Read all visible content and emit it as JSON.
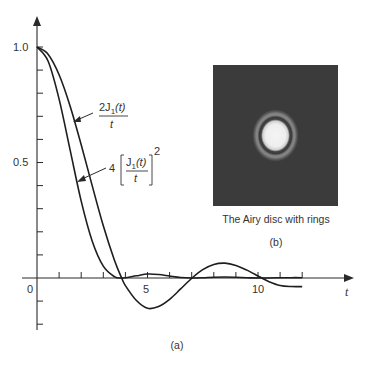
{
  "figure": {
    "panel_a_label": "(a)",
    "panel_b_label": "(b)",
    "airy_caption": "The Airy disc with rings",
    "colors": {
      "background": "#ffffff",
      "curve": "#1e1e1e",
      "airy_background": "#3b3b3b",
      "airy_disc": "#f2f2f2",
      "airy_ring": "#8a8a8a"
    }
  },
  "chart_data": {
    "type": "line",
    "title": "",
    "xlabel": "t",
    "ylabel": "",
    "xlim": [
      0,
      12.5
    ],
    "ylim": [
      -0.2,
      1.0
    ],
    "x_tick_labels": [
      "0",
      "5",
      "10"
    ],
    "x_minor_ticks": [
      1,
      2,
      3,
      4,
      5,
      6,
      7,
      8,
      9,
      10,
      11,
      12
    ],
    "y_tick_labels": [
      "1.0",
      "0.5"
    ],
    "y_minor_ticks": [
      -0.2,
      -0.1,
      0.1,
      0.2,
      0.3,
      0.4,
      0.5,
      0.6,
      0.7,
      0.8,
      0.9,
      1.0
    ],
    "grid": false,
    "legend": "inline annotations with arrows",
    "annotations": [
      {
        "label": "2J1(t)/t",
        "numerator": "2J",
        "subscript": "1",
        "arg": "(t)",
        "denominator": "t"
      },
      {
        "label": "4[J1(t)/t]^2",
        "coef": "4",
        "numerator": "J",
        "subscript": "1",
        "arg": "(t)",
        "denominator": "t",
        "power": "2"
      }
    ],
    "x": [
      0,
      0.5,
      1.0,
      1.5,
      2.0,
      2.5,
      3.0,
      3.5,
      3.8317,
      4.0,
      4.5,
      5.0,
      5.5,
      6.0,
      6.5,
      7.0156,
      7.5,
      8.0,
      8.5,
      9.0,
      9.5,
      10.0,
      10.1735,
      10.5,
      11.0,
      11.5,
      12.0
    ],
    "series": [
      {
        "name": "2J1(t)/t",
        "values": [
          1.0,
          0.9691,
          0.8801,
          0.7439,
          0.5767,
          0.3988,
          0.226,
          0.078,
          0.0,
          -0.033,
          -0.0976,
          -0.131,
          -0.1237,
          -0.0922,
          -0.0474,
          0.0,
          0.0362,
          0.0587,
          0.0642,
          0.0544,
          0.034,
          0.0087,
          0.0,
          -0.016,
          -0.0322,
          -0.037,
          -0.0372
        ]
      },
      {
        "name": "4[J1(t)/t]^2",
        "values": [
          1.0,
          0.9392,
          0.7746,
          0.5534,
          0.3326,
          0.159,
          0.0511,
          0.0061,
          0.0,
          0.0011,
          0.0095,
          0.0172,
          0.0153,
          0.0085,
          0.0022,
          0.0,
          0.0013,
          0.0034,
          0.0041,
          0.003,
          0.0012,
          0.0001,
          0.0,
          0.0003,
          0.001,
          0.0014,
          0.0014
        ]
      }
    ]
  }
}
